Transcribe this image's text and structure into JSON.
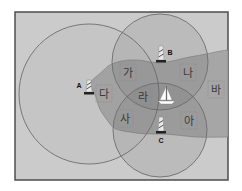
{
  "diagram": {
    "title": "",
    "colors": {
      "sea": "#cbcbcb",
      "land": "#a6a6a6",
      "frame": "#4d4d4d",
      "circle_stroke": "#6e6e6e",
      "circle_fill": "rgba(90,90,90,0.14)",
      "label_box": "#8a8a8a"
    },
    "frame": {
      "x": 15,
      "y": 12,
      "width": 213,
      "height": 168
    },
    "lighthouses": [
      {
        "id": "A",
        "label": "A",
        "x": 89,
        "y": 93,
        "label_x": 79,
        "label_y": 88
      },
      {
        "id": "B",
        "label": "B",
        "x": 161,
        "y": 62,
        "label_x": 170,
        "label_y": 55
      },
      {
        "id": "C",
        "label": "C",
        "x": 161,
        "y": 133,
        "label_x": 161,
        "label_y": 143
      }
    ],
    "circles": [
      {
        "id": "circle-A",
        "cx": 89,
        "cy": 94,
        "r": 70
      },
      {
        "id": "circle-B",
        "cx": 160,
        "cy": 62,
        "r": 48
      },
      {
        "id": "circle-C",
        "cx": 160,
        "cy": 130,
        "r": 47
      }
    ],
    "regions": [
      {
        "id": "ga",
        "label": "가",
        "x": 128,
        "y": 73
      },
      {
        "id": "na",
        "label": "나",
        "x": 188,
        "y": 73
      },
      {
        "id": "da",
        "label": "다",
        "x": 103,
        "y": 94
      },
      {
        "id": "ra",
        "label": "라",
        "x": 143,
        "y": 97
      },
      {
        "id": "ba",
        "label": "바",
        "x": 216,
        "y": 90
      },
      {
        "id": "sa",
        "label": "사",
        "x": 125,
        "y": 119
      },
      {
        "id": "a",
        "label": "아",
        "x": 189,
        "y": 121
      }
    ],
    "ship": {
      "label": "sailboat",
      "x": 166,
      "y": 96
    }
  }
}
